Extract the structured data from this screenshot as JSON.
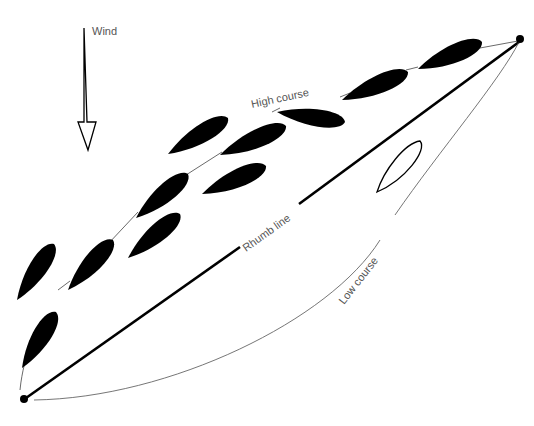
{
  "diagram": {
    "labels": {
      "wind": "Wind",
      "high_course": "High course",
      "rhumb_line": "Rhumb line",
      "low_course": "Low course"
    },
    "colors": {
      "ink": "#000000",
      "label": "#555555",
      "background": "#ffffff"
    },
    "marks": [
      {
        "name": "start-mark"
      },
      {
        "name": "finish-mark"
      }
    ],
    "boats_high_course_count": 12,
    "boats_low_course_count": 1
  }
}
